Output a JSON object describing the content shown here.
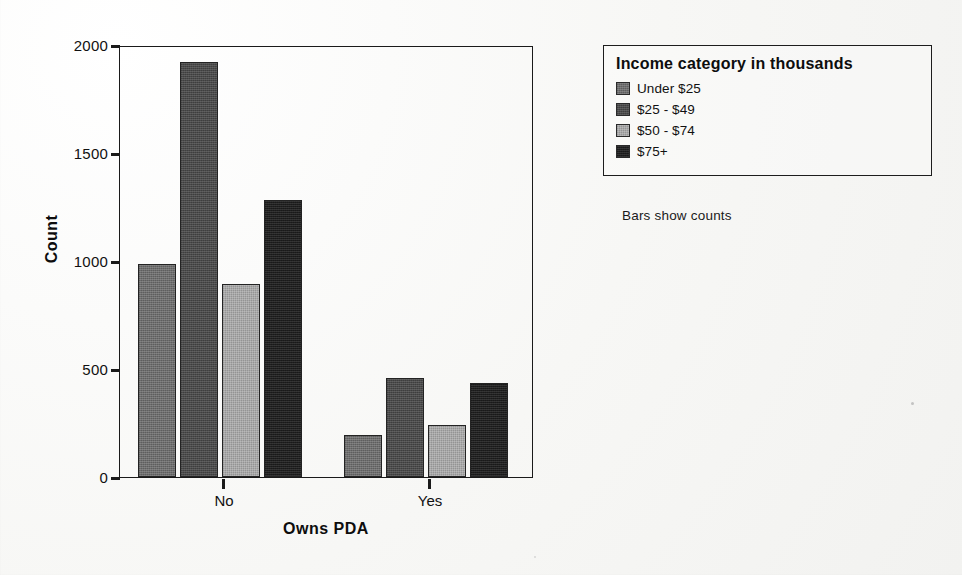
{
  "chart_data": {
    "type": "bar",
    "title": "",
    "xlabel": "Owns PDA",
    "ylabel": "Count",
    "categories": [
      "No",
      "Yes"
    ],
    "ylim": [
      0,
      2000
    ],
    "yticks": [
      "0",
      "500",
      "1000",
      "1500",
      "2000"
    ],
    "grid": false,
    "legend_position": "right",
    "legend_title": "Income category in thousands",
    "footnote": "Bars show counts",
    "series": [
      {
        "name": "Under $25",
        "color": "#6d6d6d",
        "values": [
          990,
          196
        ]
      },
      {
        "name": "$25 - $49",
        "color": "#4a4a4a",
        "values": [
          1930,
          462
        ]
      },
      {
        "name": "$50 - $74",
        "color": "#a8a8a8",
        "values": [
          900,
          240
        ]
      },
      {
        "name": "$75+",
        "color": "#1f1f1f",
        "values": [
          1290,
          437
        ]
      }
    ]
  },
  "axis": {
    "y_label": "Count",
    "x_label": "Owns PDA",
    "y_ticks": [
      "2000",
      "1500",
      "1000",
      "500",
      "0"
    ],
    "x_ticks": [
      "No",
      "Yes"
    ]
  },
  "legend": {
    "title": "Income category in thousands",
    "items": [
      {
        "label": "Under $25"
      },
      {
        "label": "$25 - $49"
      },
      {
        "label": "$50 - $74"
      },
      {
        "label": "$75+"
      }
    ]
  },
  "footnote": {
    "text": "Bars show counts"
  }
}
